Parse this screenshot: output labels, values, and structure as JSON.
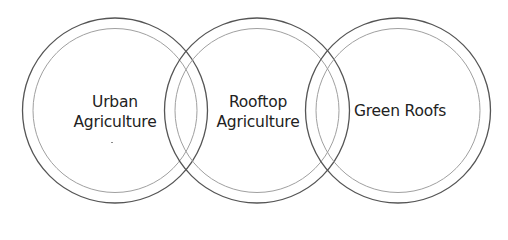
{
  "diagram": {
    "type": "venn-row",
    "stroke_colors": {
      "outer": "#555555",
      "inner": "#a0a0a0"
    },
    "circles": [
      {
        "id": "urban-agriculture",
        "label_lines": [
          "Urban",
          "Agriculture"
        ],
        "cx": 115,
        "cy": 110.5,
        "r_outer": 92.5,
        "r_inner": 82
      },
      {
        "id": "rooftop-agriculture",
        "label_lines": [
          "Rooftop",
          "Agriculture"
        ],
        "cx": 257,
        "cy": 110.5,
        "r_outer": 92.5,
        "r_inner": 82
      },
      {
        "id": "green-roofs",
        "label_lines": [
          "Green Roofs"
        ],
        "cx": 398,
        "cy": 110.5,
        "r_outer": 92.5,
        "r_inner": 82
      }
    ]
  }
}
